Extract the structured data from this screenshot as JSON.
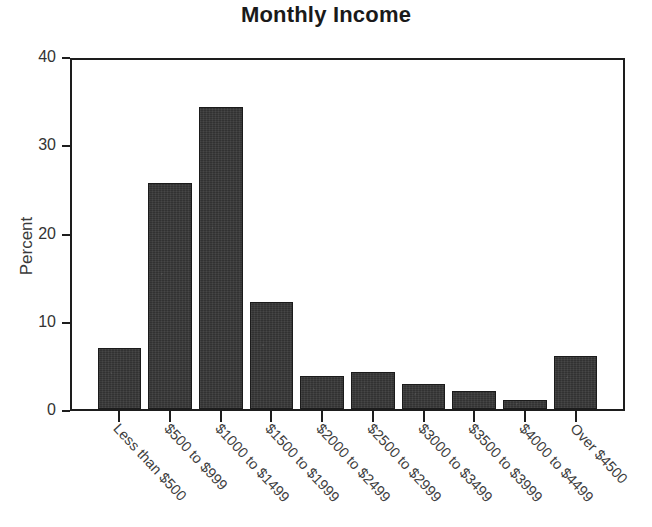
{
  "chart_data": {
    "type": "bar",
    "title": "Monthly Income",
    "xlabel": "",
    "ylabel": "Percent",
    "categories": [
      "Less than $500",
      "$500 to $999",
      "$1000 to $1499",
      "$1500 to $1999",
      "$2000 to $2499",
      "$2500 to $2999",
      "$3000 to $3499",
      "$3500 to $3999",
      "$4000 to $4499",
      "Over $4500"
    ],
    "values": [
      6.9,
      25.6,
      34.2,
      12.1,
      3.7,
      4.2,
      2.8,
      2.0,
      1.0,
      6.0
    ],
    "ylim": [
      0,
      40
    ],
    "yticks": [
      0,
      10,
      20,
      30,
      40
    ],
    "ytick_labels": [
      "0",
      "10",
      "20",
      "30",
      "40"
    ],
    "grid": false,
    "legend": null,
    "bar_color": "#323232",
    "axis_color": "#1d1d1d",
    "title_color": "#1a1a1a",
    "background": "#ffffff"
  }
}
